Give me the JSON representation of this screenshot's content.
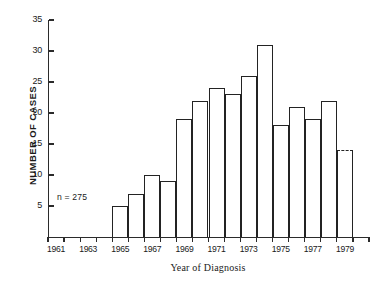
{
  "chart_data": {
    "type": "bar",
    "title": "",
    "xlabel": "Year of Diagnosis",
    "ylabel": "NUMBER OF CASES",
    "ylim": [
      0,
      35
    ],
    "yticks": [
      0,
      5,
      10,
      15,
      20,
      25,
      30,
      35
    ],
    "ytick_labels": [
      "",
      "5",
      "10",
      "15",
      "20",
      "25",
      "30",
      "35"
    ],
    "grid": false,
    "legend": null,
    "annotations": [
      {
        "text": "n = 275",
        "x": 1962.5,
        "y": 6.5
      }
    ],
    "categories": [
      "1961",
      "1962",
      "1963",
      "1964",
      "1965",
      "1966",
      "1967",
      "1968",
      "1969",
      "1970",
      "1971",
      "1972",
      "1973",
      "1974",
      "1975",
      "1976",
      "1977",
      "1978",
      "1979",
      "1980"
    ],
    "xtick_labels_shown": [
      "1961",
      "1963",
      "1965",
      "1967",
      "1969",
      "1971",
      "1973",
      "1975",
      "1977",
      "1979"
    ],
    "values": [
      0,
      0,
      0,
      0,
      5,
      7,
      10,
      9,
      19,
      22,
      24,
      23,
      26,
      31,
      18,
      21,
      19,
      22,
      14,
      0
    ],
    "bar_styles": [
      "solid",
      "solid",
      "solid",
      "solid",
      "solid",
      "solid",
      "solid",
      "solid",
      "solid",
      "solid",
      "solid",
      "solid",
      "solid",
      "solid",
      "solid",
      "solid",
      "solid",
      "solid",
      "dashed",
      "solid"
    ]
  },
  "figure": {
    "background_color": "#ffffff",
    "line_color": "#232323"
  }
}
